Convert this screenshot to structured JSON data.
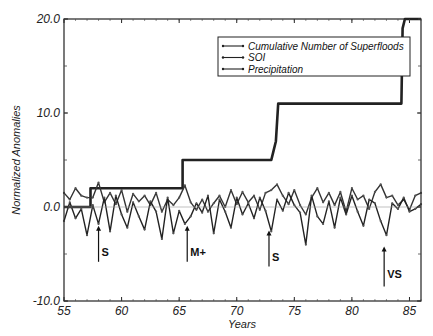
{
  "chart_data": {
    "type": "line",
    "title": "",
    "xlabel": "Years",
    "ylabel": "Normalized Anomalies",
    "xlim": [
      55,
      86
    ],
    "ylim": [
      -10,
      20
    ],
    "xticks": [
      55,
      60,
      65,
      70,
      75,
      80,
      85
    ],
    "xtick_labels": [
      "55",
      "60",
      "65",
      "70",
      "75",
      "80",
      "85"
    ],
    "yticks": [
      -10,
      0,
      10,
      20
    ],
    "ytick_labels": [
      "-10.0",
      "0.0",
      "10.0",
      "20.0"
    ],
    "grid": false,
    "legend_position": "upper center",
    "legend": [
      "Cumulative Number of Superfloods",
      "SOI",
      "Precipitation"
    ],
    "series": [
      {
        "name": "Cumulative Number of Superfloods",
        "x": [
          55,
          57.3,
          57.3,
          65.3,
          65.3,
          73.0,
          73.2,
          73.4,
          73.6,
          84.3,
          84.4,
          84.6,
          86
        ],
        "y": [
          0,
          0,
          2,
          2,
          5,
          5,
          6,
          7,
          11,
          11,
          19,
          20,
          20
        ]
      },
      {
        "name": "SOI",
        "x": [
          55,
          55.5,
          56,
          56.5,
          57,
          57.5,
          58,
          58.5,
          59,
          59.5,
          60,
          60.5,
          61,
          61.5,
          62,
          62.5,
          63,
          63.5,
          64,
          64.5,
          65,
          65.5,
          66,
          66.5,
          67,
          67.5,
          68,
          68.5,
          69,
          69.5,
          70,
          70.5,
          71,
          71.5,
          72,
          72.5,
          73,
          73.5,
          74,
          74.5,
          75,
          75.5,
          76,
          76.5,
          77,
          77.5,
          78,
          78.5,
          79,
          79.5,
          80,
          80.5,
          81,
          81.5,
          82,
          82.5,
          83,
          83.5,
          84,
          84.5,
          85,
          85.5,
          86
        ],
        "y": [
          1.5,
          0.8,
          2.0,
          1.2,
          1.0,
          1.0,
          2.6,
          0.5,
          1.5,
          0.3,
          1.8,
          -0.5,
          1.4,
          0.6,
          1.2,
          0.2,
          1.5,
          -0.5,
          0.8,
          0.2,
          1.0,
          2.3,
          0.5,
          -0.3,
          0.8,
          -0.5,
          0.4,
          1.2,
          0.0,
          1.8,
          0.3,
          1.6,
          0.5,
          1.2,
          -0.3,
          1.5,
          1.8,
          2.4,
          1.2,
          0.3,
          1.8,
          0.2,
          -0.8,
          1.0,
          2.0,
          0.5,
          1.5,
          0.2,
          1.6,
          -0.5,
          2.0,
          0.8,
          1.2,
          -0.2,
          1.6,
          2.4,
          1.0,
          1.2,
          0.2,
          0.8,
          -0.3,
          1.2,
          1.5
        ]
      },
      {
        "name": "Precipitation",
        "x": [
          55,
          55.5,
          56,
          56.5,
          57,
          57.5,
          58,
          58.5,
          59,
          59.5,
          60,
          60.5,
          61,
          61.5,
          62,
          62.5,
          63,
          63.5,
          64,
          64.5,
          65,
          65.5,
          66,
          66.5,
          67,
          67.5,
          68,
          68.5,
          69,
          69.5,
          70,
          70.5,
          71,
          71.5,
          72,
          72.5,
          73,
          73.5,
          74,
          74.5,
          75,
          75.5,
          76,
          76.5,
          77,
          77.5,
          78,
          78.5,
          79,
          79.5,
          80,
          80.5,
          81,
          81.5,
          82,
          82.5,
          83,
          83.5,
          84,
          84.5,
          85,
          85.5,
          86
        ],
        "y": [
          -1.5,
          0.5,
          -1.2,
          -0.2,
          -3.0,
          0.2,
          -1.8,
          1.0,
          -2.6,
          1.2,
          -0.8,
          -2.2,
          0.5,
          -1.0,
          -2.4,
          0.6,
          -0.5,
          -3.4,
          1.0,
          -2.8,
          -0.4,
          -1.8,
          -1.0,
          0.4,
          -0.6,
          1.2,
          -2.8,
          0.8,
          -0.5,
          -2.2,
          1.0,
          -0.8,
          0.4,
          -1.2,
          1.0,
          -0.4,
          -2.6,
          0.8,
          -0.4,
          1.5,
          0.2,
          -0.6,
          -4.0,
          1.2,
          -1.0,
          -1.8,
          0.6,
          -2.2,
          1.0,
          -0.8,
          1.2,
          -0.5,
          -2.0,
          0.8,
          0.4,
          -1.5,
          -3.0,
          0.4,
          -0.2,
          1.0,
          -0.5,
          -0.2,
          0.3
        ]
      }
    ],
    "annotations": [
      {
        "label": "S",
        "x": 58.0,
        "arrow_tip_y": -2.0
      },
      {
        "label": "M+",
        "x": 65.7,
        "arrow_tip_y": -2.0
      },
      {
        "label": "S",
        "x": 72.8,
        "arrow_tip_y": -2.5
      },
      {
        "label": "VS",
        "x": 82.8,
        "arrow_tip_y": -4.2
      }
    ]
  }
}
